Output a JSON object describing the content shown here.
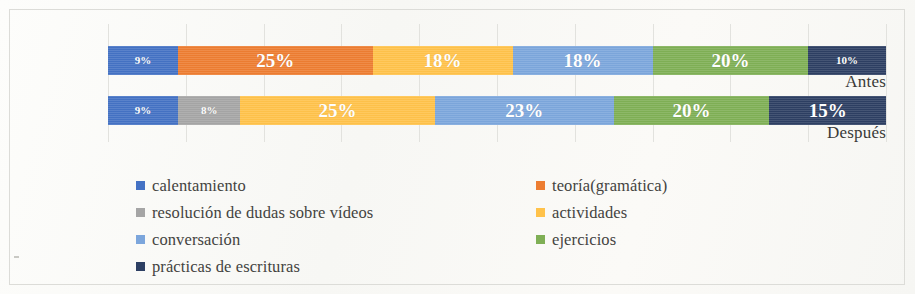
{
  "chart_data": {
    "type": "bar",
    "subtype": "100% stacked horizontal bar",
    "title": "",
    "xlabel": "",
    "ylabel": "",
    "categories": [
      "Antes",
      "Después"
    ],
    "xlim": [
      0,
      100
    ],
    "grid": true,
    "grid_interval": 10,
    "legend_position": "bottom",
    "series": [
      {
        "name": "calentamiento",
        "color": "#4472C4",
        "values": [
          9,
          9
        ],
        "labels": [
          "9%",
          "9%"
        ]
      },
      {
        "name": "teoría(gramática)",
        "color": "#ED7D31",
        "values": [
          25,
          0
        ],
        "labels": [
          "25%",
          ""
        ]
      },
      {
        "name": "resolución de dudas sobre vídeos",
        "color": "#A5A5A5",
        "values": [
          0,
          8
        ],
        "labels": [
          "",
          "8%"
        ]
      },
      {
        "name": "actividades",
        "color": "#FFC24A",
        "values": [
          18,
          25
        ],
        "labels": [
          "18%",
          "25%"
        ]
      },
      {
        "name": "conversación",
        "color": "#7CA6DC",
        "values": [
          18,
          23
        ],
        "labels": [
          "18%",
          "23%"
        ]
      },
      {
        "name": "ejercicios",
        "color": "#7FAF55",
        "values": [
          20,
          20
        ],
        "labels": [
          "20%",
          "20%"
        ]
      },
      {
        "name": "prácticas de escrituras",
        "color": "#2D3F63",
        "values": [
          10,
          15
        ],
        "labels": [
          "10%",
          "15%"
        ]
      }
    ]
  },
  "axis": {
    "category_labels": [
      "Antes",
      "Después"
    ]
  },
  "legend": {
    "items": [
      {
        "label": "calentamiento",
        "color": "#4472C4"
      },
      {
        "label": "resolución de dudas sobre vídeos",
        "color": "#A5A5A5"
      },
      {
        "label": "conversación",
        "color": "#7CA6DC"
      },
      {
        "label": "prácticas de escrituras",
        "color": "#2D3F63"
      },
      {
        "label": "teoría(gramática)",
        "color": "#ED7D31"
      },
      {
        "label": "actividades",
        "color": "#FFC24A"
      },
      {
        "label": "ejercicios",
        "color": "#7FAF55"
      }
    ]
  }
}
